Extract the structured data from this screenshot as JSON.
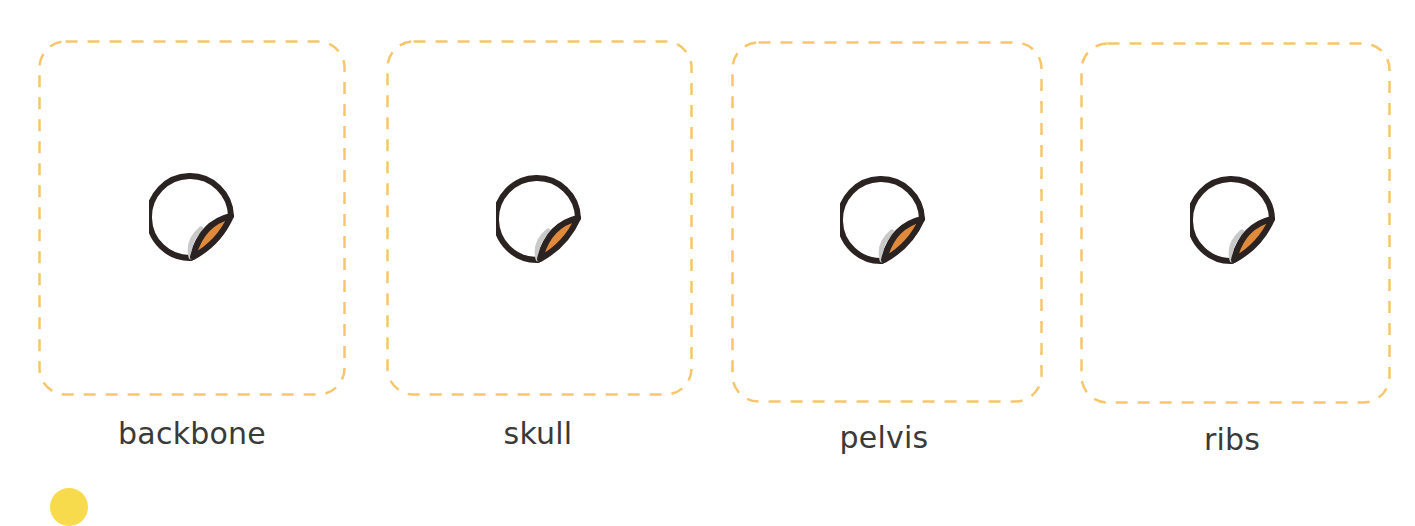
{
  "theme": {
    "frame_color": "#f7c66b",
    "icon_outline": "#2a2322",
    "icon_peel": "#e08a3c",
    "icon_shadow": "#c9c9c9",
    "label_color": "#3a3a3a",
    "accent_dot": "#f7d63a"
  },
  "cards": [
    {
      "label": "backbone",
      "icon": "sticker-peel-icon"
    },
    {
      "label": "skull",
      "icon": "sticker-peel-icon"
    },
    {
      "label": "pelvis",
      "icon": "sticker-peel-icon"
    },
    {
      "label": "ribs",
      "icon": "sticker-peel-icon"
    }
  ]
}
